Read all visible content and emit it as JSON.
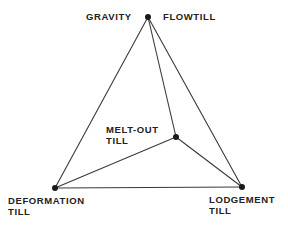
{
  "diagram": {
    "type": "tetrahedral till classification diagram",
    "colors": {
      "line": "#3a3a3a",
      "vertex": "#1a1a1a",
      "text": "#222222",
      "background": "#ffffff"
    },
    "vertices": {
      "top": {
        "id": "gravity-flowtill",
        "x": 148,
        "y": 17
      },
      "meltout": {
        "id": "melt-out-till",
        "x": 176,
        "y": 137
      },
      "deformation": {
        "id": "deformation-till",
        "x": 55,
        "y": 188
      },
      "lodgement": {
        "id": "lodgement-till",
        "x": 242,
        "y": 187
      }
    },
    "edges": [
      [
        "top",
        "deformation"
      ],
      [
        "top",
        "lodgement"
      ],
      [
        "top",
        "meltout"
      ],
      [
        "meltout",
        "deformation"
      ],
      [
        "meltout",
        "lodgement"
      ],
      [
        "deformation",
        "lodgement"
      ]
    ],
    "labels": {
      "gravity": "GRAVITY",
      "flowtill": "FLOWTILL",
      "meltout_line1": "MELT-OUT",
      "meltout_line2": "TILL",
      "deformation_line1": "DEFORMATION",
      "deformation_line2": "TILL",
      "lodgement_line1": "LODGEMENT",
      "lodgement_line2": "TILL"
    }
  }
}
